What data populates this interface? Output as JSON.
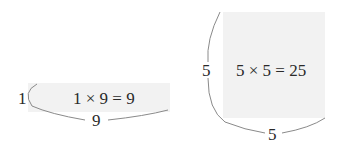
{
  "diagram": {
    "rectangle": {
      "side_label": "1",
      "bottom_label": "9",
      "equation": "1 × 9 = 9"
    },
    "square": {
      "side_label": "5",
      "bottom_label": "5",
      "equation": "5 × 5 = 25"
    },
    "colors": {
      "fill": "#f2f2f2",
      "bracket": "#8a8a8a",
      "text": "#2a2a2a"
    }
  }
}
